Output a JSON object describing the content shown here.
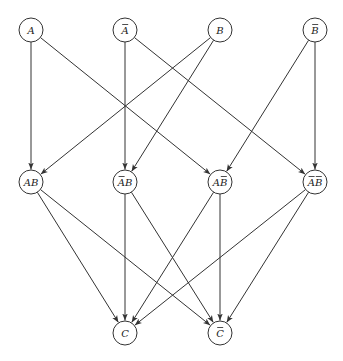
{
  "diagram": {
    "type": "directed-graph",
    "node_radius": 12,
    "colors": {
      "stroke": "#333333",
      "background": "#ffffff",
      "text": "#222222"
    },
    "nodes": [
      {
        "id": "A",
        "label": "A",
        "overline": [],
        "x": 31,
        "y": 30
      },
      {
        "id": "notA",
        "label": "A",
        "overline": [
          0
        ],
        "x": 125,
        "y": 30
      },
      {
        "id": "B",
        "label": "B",
        "overline": [],
        "x": 220,
        "y": 30
      },
      {
        "id": "notB",
        "label": "B",
        "overline": [
          0
        ],
        "x": 315,
        "y": 30
      },
      {
        "id": "AB",
        "label": "AB",
        "overline": [],
        "x": 31,
        "y": 182
      },
      {
        "id": "notA_B",
        "label": "AB",
        "overline": [
          0
        ],
        "x": 125,
        "y": 182
      },
      {
        "id": "A_notB",
        "label": "AB",
        "overline": [
          1
        ],
        "x": 220,
        "y": 182
      },
      {
        "id": "notA_notB",
        "label": "AB",
        "overline": [
          0,
          1
        ],
        "x": 315,
        "y": 182
      },
      {
        "id": "C",
        "label": "C",
        "overline": [],
        "x": 125,
        "y": 333
      },
      {
        "id": "notC",
        "label": "C",
        "overline": [
          0
        ],
        "x": 220,
        "y": 333
      }
    ],
    "edges": [
      {
        "from": "A",
        "to": "AB"
      },
      {
        "from": "A",
        "to": "A_notB"
      },
      {
        "from": "notA",
        "to": "notA_B"
      },
      {
        "from": "notA",
        "to": "notA_notB"
      },
      {
        "from": "B",
        "to": "AB"
      },
      {
        "from": "B",
        "to": "notA_B"
      },
      {
        "from": "notB",
        "to": "A_notB"
      },
      {
        "from": "notB",
        "to": "notA_notB"
      },
      {
        "from": "AB",
        "to": "C"
      },
      {
        "from": "AB",
        "to": "notC"
      },
      {
        "from": "notA_B",
        "to": "C"
      },
      {
        "from": "notA_B",
        "to": "notC"
      },
      {
        "from": "A_notB",
        "to": "C"
      },
      {
        "from": "A_notB",
        "to": "notC"
      },
      {
        "from": "notA_notB",
        "to": "C"
      },
      {
        "from": "notA_notB",
        "to": "notC"
      }
    ]
  }
}
